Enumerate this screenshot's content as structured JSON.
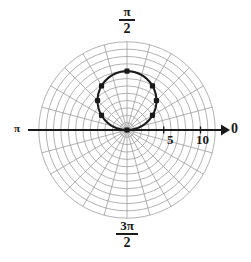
{
  "figure": {
    "kind": "polar-plot",
    "background_color": "#ffffff",
    "grid_color": "#9a9a9a",
    "axis_color": "#1a1a1a",
    "curve_color": "#1a1a1a"
  },
  "angle_labels": {
    "right": "0",
    "top_numerator": "π",
    "top_denominator": "2",
    "left": "π",
    "bottom_numerator": "3π",
    "bottom_denominator": "2"
  },
  "radial_ticks": {
    "labels": [
      "5",
      "10"
    ],
    "values": [
      5,
      10
    ]
  },
  "chart_data": {
    "type": "line",
    "title": "",
    "subtitle": "",
    "coordinate_system": "polar",
    "equation": "r = 8 sin(θ)",
    "xlabel": "",
    "ylabel": "",
    "theta_axis_labels": [
      "0",
      "π/2",
      "π",
      "3π/2"
    ],
    "theta_axis_values_rad": [
      0,
      1.5708,
      3.14159,
      4.71239
    ],
    "r_tick_labels": [
      "5",
      "10"
    ],
    "r_tick_values": [
      5,
      10
    ],
    "rlim": [
      0,
      12
    ],
    "r_grid_step": 1,
    "theta_grid_step_deg": 15,
    "grid": true,
    "legend": "none",
    "series": [
      {
        "name": "r = 8 sin(θ)",
        "closed": true,
        "theta_deg": [
          0,
          15,
          30,
          45,
          60,
          75,
          90,
          105,
          120,
          135,
          150,
          165,
          180
        ],
        "r": [
          0,
          2.07,
          4.0,
          5.66,
          6.93,
          7.73,
          8.0,
          7.73,
          6.93,
          5.66,
          4.0,
          2.07,
          0
        ]
      }
    ],
    "marked_points": [
      {
        "theta_deg": 0,
        "r": 0
      },
      {
        "theta_deg": 30,
        "r": 4.0
      },
      {
        "theta_deg": 45,
        "r": 5.66
      },
      {
        "theta_deg": 60,
        "r": 6.93
      },
      {
        "theta_deg": 90,
        "r": 8.0
      },
      {
        "theta_deg": 120,
        "r": 6.93
      },
      {
        "theta_deg": 135,
        "r": 5.66
      },
      {
        "theta_deg": 150,
        "r": 4.0
      }
    ]
  }
}
